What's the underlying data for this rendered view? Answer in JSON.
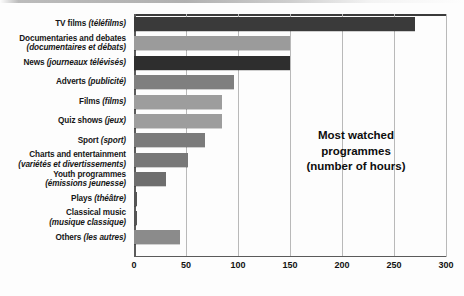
{
  "chart_data": {
    "type": "bar",
    "orientation": "horizontal",
    "title": "Most watched programmes (number of hours)",
    "title_lines": [
      "Most watched",
      "programmes",
      "(number of hours)"
    ],
    "xlabel": "",
    "ylabel": "",
    "xlim": [
      0,
      300
    ],
    "xticks": [
      0,
      50,
      100,
      150,
      200,
      250,
      300
    ],
    "xtick_labels": [
      "0",
      "50",
      "100",
      "150",
      "200",
      "250",
      "300"
    ],
    "grid": "vertical",
    "legend": "none",
    "categories": [
      "TV films (téléfilms)",
      "Documentaries and debates (documentaires et débats)",
      "News (journeaux télévisés)",
      "Adverts (publicité)",
      "Films (films)",
      "Quiz shows (jeux)",
      "Sport (sport)",
      "Charts and entertainment (variétés et divertissements)",
      "Youth programmes (émissions jeunesse)",
      "Plays (théâtre)",
      "Classical music (musique classique)",
      "Others (les autres)"
    ],
    "values": [
      270,
      150,
      150,
      96,
      85,
      85,
      68,
      52,
      31,
      3,
      3,
      44
    ],
    "bars": [
      {
        "en": "TV films",
        "fr": "(téléfilms)",
        "two_line": false,
        "value": 270,
        "color": "#3a3a3a"
      },
      {
        "en": "Documentaries and debates",
        "fr": "(documentaires et débats)",
        "two_line": true,
        "value": 150,
        "color": "#9b9b9b"
      },
      {
        "en": "News",
        "fr": "(journeaux télévisés)",
        "two_line": false,
        "value": 150,
        "color": "#2e2e2e"
      },
      {
        "en": "Adverts",
        "fr": "(publicité)",
        "two_line": false,
        "value": 96,
        "color": "#7f7f7f"
      },
      {
        "en": "Films",
        "fr": "(films)",
        "two_line": false,
        "value": 85,
        "color": "#9d9d9d"
      },
      {
        "en": "Quiz shows",
        "fr": "(jeux)",
        "two_line": false,
        "value": 85,
        "color": "#9d9d9d"
      },
      {
        "en": "Sport",
        "fr": "(sport)",
        "two_line": false,
        "value": 68,
        "color": "#7b7b7b"
      },
      {
        "en": "Charts and entertainment",
        "fr": "(variétés et divertissements)",
        "two_line": true,
        "value": 52,
        "color": "#787878"
      },
      {
        "en": "Youth programmes",
        "fr": "(émissions jeunesse)",
        "two_line": true,
        "value": 31,
        "color": "#6e6e6e"
      },
      {
        "en": "Plays",
        "fr": "(théâtre)",
        "two_line": false,
        "value": 3,
        "color": "#555555"
      },
      {
        "en": "Classical music",
        "fr": "(musique classique)",
        "two_line": true,
        "value": 3,
        "color": "#555555"
      },
      {
        "en": "Others",
        "fr": "(les autres)",
        "two_line": false,
        "value": 44,
        "color": "#8b8b8b"
      }
    ],
    "colors": {
      "axis": "#5b5b5b",
      "gridline": "#b9b9b9",
      "background": "#fdfdfd",
      "text": "#161616"
    }
  }
}
